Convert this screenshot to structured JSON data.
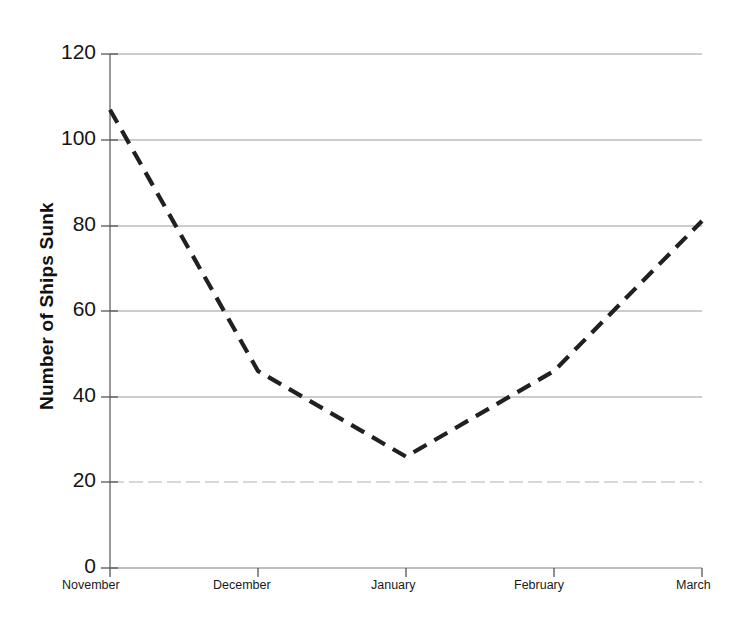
{
  "chart_data": {
    "type": "line",
    "title": "",
    "xlabel": "",
    "ylabel": "Number of Ships Sunk",
    "categories": [
      "November",
      "December",
      "January",
      "February",
      "March"
    ],
    "values": [
      107,
      46,
      26,
      46,
      81
    ],
    "series": [
      {
        "name": "Number of Ships Sunk",
        "values": [
          107,
          46,
          26,
          46,
          81
        ]
      }
    ],
    "ylim": [
      0,
      120
    ],
    "yticks": [
      0,
      20,
      40,
      60,
      80,
      100,
      120
    ],
    "ytick_labels": [
      "0",
      "20",
      "40",
      "60",
      "80",
      "100",
      "120"
    ],
    "grid": "horizontal",
    "legend": "none",
    "line_style": "dashed",
    "line_color": "#202020",
    "grid_color": "#9a9a9a",
    "axis_color": "#6e6e6e",
    "markers": "none"
  }
}
